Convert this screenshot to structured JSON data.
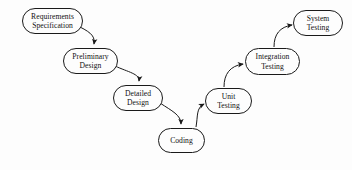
{
  "diagram": {
    "background_color": "#fdfdfd",
    "stroke_color": "#1a1a1a",
    "text_color": "#111111",
    "nodes": [
      {
        "id": "requirements-specification",
        "line1": "Requirements",
        "line2": "Specification",
        "x": 22,
        "y": 8,
        "w": 61,
        "h": 26
      },
      {
        "id": "preliminary-design",
        "line1": "Preliminary",
        "line2": "Design",
        "x": 63,
        "y": 48,
        "w": 55,
        "h": 26
      },
      {
        "id": "detailed-design",
        "line1": "Detailed",
        "line2": "Design",
        "x": 113,
        "y": 85,
        "w": 50,
        "h": 26
      },
      {
        "id": "coding",
        "line1": "Coding",
        "line2": "",
        "x": 158,
        "y": 128,
        "w": 47,
        "h": 25
      },
      {
        "id": "unit-testing",
        "line1": "Unit",
        "line2": "Testing",
        "x": 205,
        "y": 88,
        "w": 47,
        "h": 26
      },
      {
        "id": "integration-testing",
        "line1": "Integration",
        "line2": "Testing",
        "x": 245,
        "y": 48,
        "w": 55,
        "h": 27
      },
      {
        "id": "system-testing",
        "line1": "System",
        "line2": "Testing",
        "x": 293,
        "y": 10,
        "w": 50,
        "h": 26
      }
    ],
    "edges": [
      {
        "id": "requirements-to-preliminary",
        "from": "requirements-specification",
        "to": "preliminary-design",
        "direction": "down-right"
      },
      {
        "id": "preliminary-to-detailed",
        "from": "preliminary-design",
        "to": "detailed-design",
        "direction": "down-right"
      },
      {
        "id": "detailed-to-coding",
        "from": "detailed-design",
        "to": "coding",
        "direction": "down-right"
      },
      {
        "id": "coding-to-unit",
        "from": "coding",
        "to": "unit-testing",
        "direction": "up-right"
      },
      {
        "id": "unit-to-integration",
        "from": "unit-testing",
        "to": "integration-testing",
        "direction": "up-right"
      },
      {
        "id": "integration-to-system",
        "from": "integration-testing",
        "to": "system-testing",
        "direction": "up-right"
      }
    ]
  }
}
